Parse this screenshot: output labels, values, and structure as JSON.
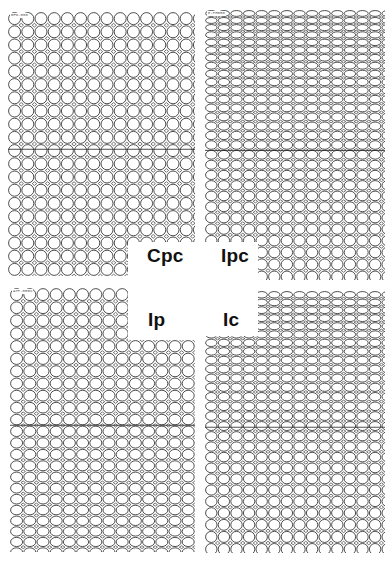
{
  "figure": {
    "background": "#ffffff",
    "line_color": "#3a3a3a",
    "panels": [
      {
        "id": "cpc",
        "label": "Cpc",
        "code": "BFO-050",
        "box": {
          "x": 8,
          "y": 12,
          "w": 187,
          "h": 264
        },
        "cutout": {
          "x": 128,
          "y": 242,
          "w": 70,
          "h": 40
        },
        "cell": {
          "pitch": 13.2,
          "ry_top": 1.0,
          "ry_bottom": 1.0
        },
        "description": "uniform circular cells"
      },
      {
        "id": "ipc",
        "label": "Ipc",
        "code": "E-PH050",
        "box": {
          "x": 205,
          "y": 10,
          "w": 180,
          "h": 270
        },
        "cutout": {
          "x": 200,
          "y": 242,
          "w": 58,
          "h": 40
        },
        "cell": {
          "pitch": 12.6,
          "ry_top": 0.55,
          "ry_bottom": 1.0
        },
        "description": "compressed cells at top grading to circular at bottom"
      },
      {
        "id": "ip",
        "label": "Ip",
        "code": "ATP-050%",
        "box": {
          "x": 10,
          "y": 288,
          "w": 185,
          "h": 264
        },
        "cutout": {
          "x": 128,
          "y": 284,
          "w": 70,
          "h": 56
        },
        "cell": {
          "pitch": 13.2,
          "ry_top": 1.0,
          "ry_bottom": 0.78
        },
        "description": "circular cells at top grading to elongated at bottom"
      },
      {
        "id": "ic",
        "label": "Ic",
        "code": "",
        "box": {
          "x": 205,
          "y": 291,
          "w": 180,
          "h": 262
        },
        "cutout": {
          "x": 200,
          "y": 286,
          "w": 58,
          "h": 50
        },
        "cell": {
          "pitch": 12.6,
          "ry_top": 0.6,
          "ry_bottom": 1.0
        },
        "description": "elongated cells at top grading to circular at bottom"
      }
    ],
    "labels": [
      {
        "text": "Cpc",
        "x": 147,
        "y": 245
      },
      {
        "text": "Ipc",
        "x": 221,
        "y": 245
      },
      {
        "text": "Ip",
        "x": 148,
        "y": 309
      },
      {
        "text": "Ic",
        "x": 223,
        "y": 309
      }
    ]
  }
}
